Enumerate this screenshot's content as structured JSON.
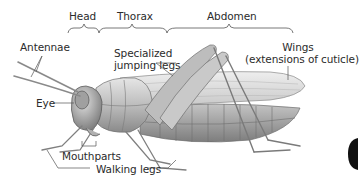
{
  "diagram": {
    "regions": [
      {
        "label": "Head"
      },
      {
        "label": "Thorax"
      },
      {
        "label": "Abdomen"
      }
    ],
    "labels": {
      "antennae": "Antennae",
      "eye": "Eye",
      "mouthparts": "Mouthparts",
      "walking_legs": "Walking legs",
      "jumping_legs_line1": "Specialized",
      "jumping_legs_line2": "jumping legs",
      "wings_line1": "Wings",
      "wings_line2": "(extensions of cuticle)"
    },
    "colors": {
      "text": "#2b2b2b",
      "leader": "#555555",
      "body_light": "#d9d9d9",
      "body_mid": "#a8a8a8",
      "body_dark": "#6e6e6e"
    }
  }
}
